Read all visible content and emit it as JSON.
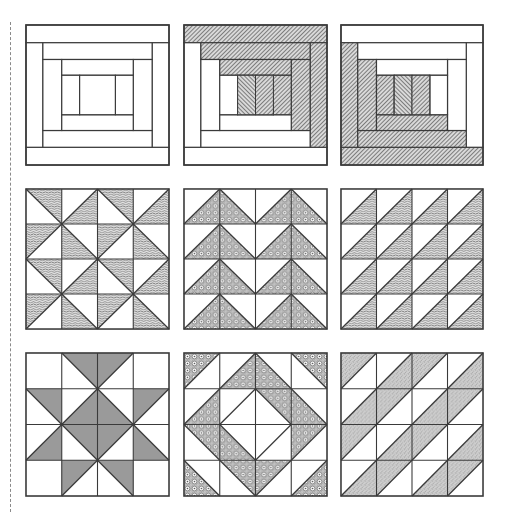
{
  "page": {
    "width": 507,
    "height": 518,
    "background": "#ffffff"
  },
  "colors": {
    "line": "#3a3a3a",
    "ink": "#4a4a4a",
    "paper": "#ffffff",
    "cut_line": "#8a8a8a"
  },
  "cut_line": {
    "x": 10,
    "y_start": 22,
    "y_end": 512,
    "style": "dashed"
  },
  "grid": {
    "rows": 3,
    "cols": 3
  },
  "blocks": [
    {
      "id": "log-cabin-plain",
      "row": 0,
      "col": 0,
      "x": 25,
      "y": 24,
      "w": 145,
      "h": 142,
      "type": "log-cabin",
      "shading": "none",
      "pattern": "none"
    },
    {
      "id": "log-cabin-top-right",
      "row": 0,
      "col": 1,
      "x": 183,
      "y": 24,
      "w": 145,
      "h": 142,
      "type": "log-cabin",
      "shading": "top-right",
      "pattern": "hatch"
    },
    {
      "id": "log-cabin-bottom-left",
      "row": 0,
      "col": 2,
      "x": 340,
      "y": 24,
      "w": 144,
      "h": 142,
      "type": "log-cabin",
      "shading": "bottom-left",
      "pattern": "hatch"
    },
    {
      "id": "pinwheel-triangles",
      "row": 1,
      "col": 0,
      "x": 25,
      "y": 188,
      "w": 145,
      "h": 142,
      "type": "half-square-grid",
      "pattern": "wave",
      "cells": [
        [
          [
            "\\",
            "TR"
          ],
          [
            "/",
            "BR"
          ],
          [
            "\\",
            "TR"
          ],
          [
            "/",
            "BR"
          ]
        ],
        [
          [
            "/",
            "TL"
          ],
          [
            "\\",
            "BL"
          ],
          [
            "/",
            "TL"
          ],
          [
            "\\",
            "BL"
          ]
        ],
        [
          [
            "\\",
            "TR"
          ],
          [
            "/",
            "BR"
          ],
          [
            "\\",
            "TR"
          ],
          [
            "/",
            "BR"
          ]
        ],
        [
          [
            "/",
            "TL"
          ],
          [
            "\\",
            "BL"
          ],
          [
            "/",
            "TL"
          ],
          [
            "\\",
            "BL"
          ]
        ]
      ]
    },
    {
      "id": "flying-geese",
      "row": 1,
      "col": 1,
      "x": 183,
      "y": 188,
      "w": 145,
      "h": 142,
      "type": "half-square-grid",
      "pattern": "dots",
      "cells": [
        [
          [
            "/",
            "BR"
          ],
          [
            "\\",
            "BL"
          ],
          [
            "/",
            "BR"
          ],
          [
            "\\",
            "BL"
          ]
        ],
        [
          [
            "/",
            "BR"
          ],
          [
            "\\",
            "BL"
          ],
          [
            "/",
            "BR"
          ],
          [
            "\\",
            "BL"
          ]
        ],
        [
          [
            "/",
            "BR"
          ],
          [
            "\\",
            "BL"
          ],
          [
            "/",
            "BR"
          ],
          [
            "\\",
            "BL"
          ]
        ],
        [
          [
            "/",
            "BR"
          ],
          [
            "\\",
            "BL"
          ],
          [
            "/",
            "BR"
          ],
          [
            "\\",
            "BL"
          ]
        ]
      ]
    },
    {
      "id": "sawtooth-triangles",
      "row": 1,
      "col": 2,
      "x": 340,
      "y": 188,
      "w": 144,
      "h": 142,
      "type": "half-square-grid",
      "pattern": "wave",
      "cells": [
        [
          [
            "/",
            "BR"
          ],
          [
            "/",
            "BR"
          ],
          [
            "/",
            "BR"
          ],
          [
            "/",
            "BR"
          ]
        ],
        [
          [
            "/",
            "BR"
          ],
          [
            "/",
            "BR"
          ],
          [
            "/",
            "BR"
          ],
          [
            "/",
            "BR"
          ]
        ],
        [
          [
            "/",
            "BR"
          ],
          [
            "/",
            "BR"
          ],
          [
            "/",
            "BR"
          ],
          [
            "/",
            "BR"
          ]
        ],
        [
          [
            "/",
            "BR"
          ],
          [
            "/",
            "BR"
          ],
          [
            "/",
            "BR"
          ],
          [
            "/",
            "BR"
          ]
        ]
      ]
    },
    {
      "id": "ohio-star",
      "row": 2,
      "col": 0,
      "x": 25,
      "y": 352,
      "w": 145,
      "h": 145,
      "type": "half-square-grid",
      "pattern": "solid",
      "cells": [
        [
          [
            "",
            ""
          ],
          [
            "\\",
            "TR"
          ],
          [
            "/",
            "TL"
          ],
          [
            "",
            ""
          ]
        ],
        [
          [
            "\\",
            "TR"
          ],
          [
            "/",
            "BR"
          ],
          [
            "\\",
            "BL"
          ],
          [
            "/",
            "TL"
          ]
        ],
        [
          [
            "/",
            "BR"
          ],
          [
            "\\",
            "TR"
          ],
          [
            "/",
            "TL"
          ],
          [
            "\\",
            "BL"
          ]
        ],
        [
          [
            "",
            ""
          ],
          [
            "/",
            "TL"
          ],
          [
            "\\",
            "TR"
          ],
          [
            "",
            ""
          ]
        ]
      ]
    },
    {
      "id": "diamond-in-square",
      "row": 2,
      "col": 1,
      "x": 183,
      "y": 352,
      "w": 145,
      "h": 145,
      "type": "half-square-grid",
      "pattern": "dots",
      "cells": [
        [
          [
            "/",
            "TL"
          ],
          [
            "/",
            "BR"
          ],
          [
            "\\",
            "BL"
          ],
          [
            "\\",
            "TR"
          ]
        ],
        [
          [
            "/",
            "BR"
          ],
          [
            "/",
            ""
          ],
          [
            "\\",
            "TR"
          ],
          [
            "\\",
            "BL"
          ]
        ],
        [
          [
            "\\",
            "TR"
          ],
          [
            "\\",
            "BL"
          ],
          [
            "/",
            ""
          ],
          [
            "/",
            "TL"
          ]
        ],
        [
          [
            "\\",
            "BL"
          ],
          [
            "\\",
            "TR"
          ],
          [
            "/",
            "TL"
          ],
          [
            "/",
            "BR"
          ]
        ]
      ]
    },
    {
      "id": "streak-of-lightning",
      "row": 2,
      "col": 2,
      "x": 340,
      "y": 352,
      "w": 144,
      "h": 145,
      "type": "half-square-grid",
      "pattern": "stipple",
      "cells": [
        [
          [
            "/",
            "TL"
          ],
          [
            "/",
            "BR"
          ],
          [
            "/",
            "TL"
          ],
          [
            "/",
            "BR"
          ]
        ],
        [
          [
            "/",
            "BR"
          ],
          [
            "/",
            "TL"
          ],
          [
            "/",
            "BR"
          ],
          [
            "/",
            "TL"
          ]
        ],
        [
          [
            "/",
            "TL"
          ],
          [
            "/",
            "BR"
          ],
          [
            "/",
            "TL"
          ],
          [
            "/",
            "BR"
          ]
        ],
        [
          [
            "/",
            "BR"
          ],
          [
            "/",
            "TL"
          ],
          [
            "/",
            "BR"
          ],
          [
            "/",
            "TL"
          ]
        ]
      ]
    }
  ]
}
